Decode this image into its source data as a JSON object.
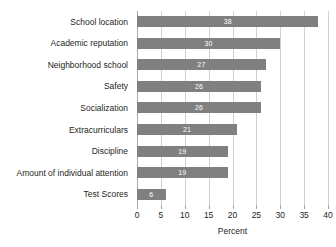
{
  "chart_data": {
    "type": "bar",
    "orientation": "horizontal",
    "title": "",
    "xlabel": "Percent",
    "ylabel": "",
    "xlim": [
      0,
      40
    ],
    "xticks": [
      0,
      5,
      10,
      15,
      20,
      25,
      30,
      35,
      40
    ],
    "grid": "vertical",
    "legend": "none",
    "bar_color": "#808080",
    "value_label_color": "#ffffff",
    "categories": [
      "School location",
      "Academic reputation",
      "Neighborhood school",
      "Safety",
      "Socialization",
      "Extracurriculars",
      "Discipline",
      "Amount of individual attention",
      "Test Scores"
    ],
    "values": [
      38,
      30,
      27,
      26,
      26,
      21,
      19,
      19,
      6
    ],
    "value_labels": [
      "38",
      "30",
      "27",
      "26",
      "26",
      "21",
      "19",
      "19",
      "6"
    ]
  }
}
